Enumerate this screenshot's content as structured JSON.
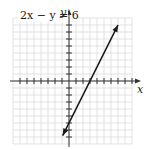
{
  "figure": {
    "equation": "2x − y = 6",
    "x_axis_label": "x",
    "y_axis_label": "y"
  },
  "chart_data": {
    "type": "line",
    "title": "2x − y = 6",
    "xlabel": "x",
    "ylabel": "y",
    "grid": true,
    "xlim": [
      -8,
      9
    ],
    "ylim": [
      -9,
      9
    ],
    "tick_spacing": 1,
    "series": [
      {
        "name": "2x − y = 6",
        "equation": "y = 2x - 6",
        "x": [
          -0.9,
          0,
          3,
          7
        ],
        "y": [
          -7.8,
          -6,
          0,
          8
        ],
        "x_intercept": 3,
        "y_intercept": -6
      }
    ]
  },
  "colors": {
    "grid": "#dcdcdc",
    "axis": "#333333",
    "line": "#1a1a1a",
    "background": "#ffffff"
  }
}
